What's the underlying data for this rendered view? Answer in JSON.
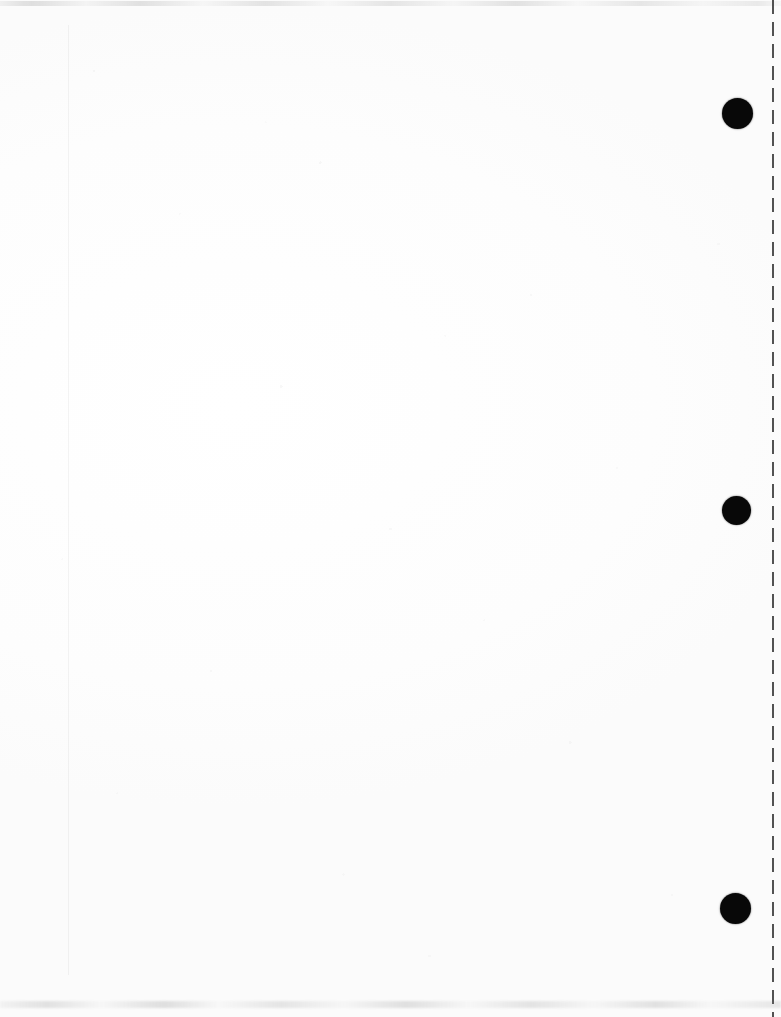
{
  "document": {
    "type": "scanned-page",
    "title": "Blank scanned document page",
    "page_width": 781,
    "page_height": 1017,
    "paper_color": "#ffffff",
    "ink_color": "#080808",
    "body_text": "",
    "visible_text": "",
    "notes_label": "",
    "orientation": "portrait"
  },
  "marks": {
    "holes_label": "punch-holes",
    "holes": [
      {
        "id": "hole-top",
        "cx": 737,
        "cy": 113,
        "d": 31,
        "color": "#080808"
      },
      {
        "id": "hole-middle",
        "cx": 736,
        "cy": 510,
        "d": 29,
        "color": "#080808"
      },
      {
        "id": "hole-bottom",
        "cx": 735,
        "cy": 908,
        "d": 31,
        "color": "#080808"
      }
    ],
    "perforation": {
      "label": "perforation-line",
      "x": 772,
      "dash_length": 14,
      "gap_length": 8,
      "color": "#3b3b3b"
    },
    "margin_rule": {
      "label": "left-margin-rule",
      "x": 68,
      "top": 25,
      "bottom": 975,
      "color": "#f2f2f2"
    },
    "smudges": {
      "top_band_y": 2,
      "bottom_band_y": 1004,
      "color": "#8c8c8c"
    }
  }
}
